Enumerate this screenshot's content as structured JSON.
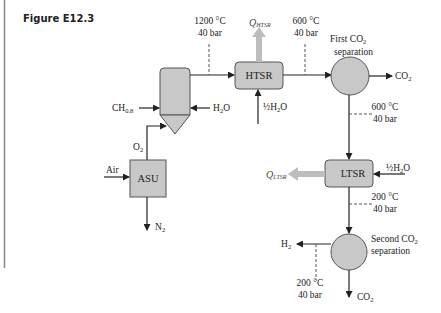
{
  "figure_label": "Figure E12.3",
  "units": {
    "asu": "ASU",
    "htsr": "HTSR",
    "ltsr": "LTSR"
  },
  "streams": {
    "ch": "CH",
    "ch_sub": "0.8",
    "h2o_gasifier": "H",
    "h2o_gasifier_sub": "2",
    "h2o_gasifier_end": "O",
    "o2": "O",
    "o2_sub": "2",
    "air": "Air",
    "n2": "N",
    "n2_sub": "2",
    "half_h2o_htsr": "½H",
    "half_h2o_htsr_sub": "2",
    "half_h2o_htsr_end": "O",
    "half_h2o_ltsr": "½H",
    "half_h2o_ltsr_sub": "2",
    "half_h2o_ltsr_end": "O",
    "co2_first": "CO",
    "co2_first_sub": "2",
    "co2_second": "CO",
    "co2_second_sub": "2",
    "h2": "H",
    "h2_sub": "2"
  },
  "heat": {
    "q_htsr": "Q",
    "q_htsr_sub": "HTSR",
    "q_ltsr": "Q",
    "q_ltsr_sub": "LTSR"
  },
  "separators": {
    "first_line1": "First CO",
    "first_sub": "2",
    "first_line2": "separation",
    "second_line1": "Second CO",
    "second_sub": "2",
    "second_line2": "separation"
  },
  "conditions": {
    "gasifier_out_temp": "1200 °C",
    "gasifier_out_pres": "40 bar",
    "htsr_out_temp": "600 °C",
    "htsr_out_pres": "40 bar",
    "sep1_out_temp": "600 °C",
    "sep1_out_pres": "40 bar",
    "ltsr_out_temp": "200 °C",
    "ltsr_out_pres": "40 bar",
    "h2_out_temp": "200 °C",
    "h2_out_pres": "40 bar"
  }
}
